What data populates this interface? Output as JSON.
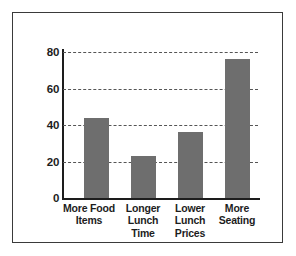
{
  "chart_data": {
    "type": "bar",
    "title": "",
    "subtitle": "",
    "xlabel": "",
    "ylabel": "",
    "categories": [
      "More Food Items",
      "Longer Lunch Time",
      "Lower Lunch Prices",
      "More Seating"
    ],
    "category_lines": [
      [
        "More Food",
        "Items"
      ],
      [
        "Longer",
        "Lunch",
        "Time"
      ],
      [
        "Lower",
        "Lunch",
        "Prices"
      ],
      [
        "More",
        "Seating"
      ]
    ],
    "values": [
      44,
      23,
      36,
      76
    ],
    "ylim": [
      0,
      80
    ],
    "yticks": [
      0,
      20,
      40,
      60,
      80
    ],
    "ytick_labels": [
      "0",
      "20",
      "40",
      "60",
      "80"
    ],
    "grid": "horizontal-dashed",
    "legend": "none",
    "bar_color": "#6e6e6e",
    "axis_color": "#1d1d1d",
    "grid_color": "#555555",
    "frame_color": "#3a3a3a",
    "background_color": "#ffffff"
  }
}
